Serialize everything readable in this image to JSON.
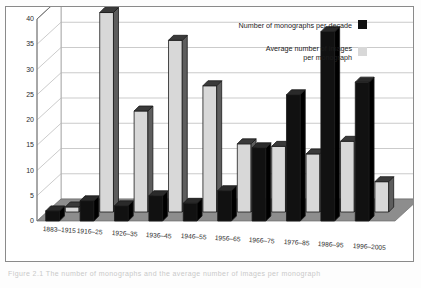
{
  "figure": {
    "caption": "Figure 2.1  The number of monographs and the average number of images per monograph"
  },
  "legend": {
    "position": "top-right-inside",
    "entries": [
      {
        "label": "Number of monographs per decade",
        "key": "dark-square-key",
        "color": "#111111"
      },
      {
        "label": "Average number of images\nper monograph",
        "label_line1": "Average number of images",
        "label_line2": "per monograph",
        "key": "light-square-key",
        "color": "#d8d8d8"
      }
    ]
  },
  "axes": {
    "y_ticks": [
      "0",
      "5",
      "10",
      "15",
      "20",
      "25",
      "30",
      "35",
      "40"
    ],
    "y_min": 0,
    "y_max": 40,
    "y_step": 5,
    "grid": true
  },
  "chart_data": {
    "type": "bar",
    "title": "",
    "xlabel": "",
    "ylabel": "",
    "ylim": [
      0,
      40
    ],
    "categories": [
      "1883–1915",
      "1916–25",
      "1926–35",
      "1936–45",
      "1946–55",
      "1956–65",
      "1966–75",
      "1976–85",
      "1986–95",
      "1996–2005"
    ],
    "series": [
      {
        "name": "Number of monographs per decade",
        "color": "#111111",
        "values": [
          2,
          4,
          3,
          5,
          3.5,
          6,
          14.5,
          25,
          37.5,
          27.5
        ]
      },
      {
        "name": "Average number of images per monograph",
        "color": "#d8d8d8",
        "values": [
          1,
          39.5,
          20,
          34,
          25,
          13.5,
          13,
          11.5,
          14,
          6
        ]
      }
    ]
  },
  "style": {
    "accent_dark": "#111111",
    "accent_light": "#d8d8d8",
    "floor": "#8d8d8d",
    "wall": "#ffffff",
    "grid_line": "#b4b4b4",
    "frame": "#8a8a8a"
  }
}
